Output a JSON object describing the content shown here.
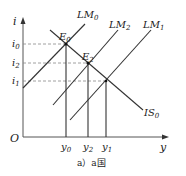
{
  "diagram": {
    "type": "IS-LM",
    "axes": {
      "y_label": "i",
      "x_label": "y",
      "origin": "O"
    },
    "curves": {
      "LM0": {
        "name": "LM",
        "sub": "0"
      },
      "LM2": {
        "name": "LM",
        "sub": "2"
      },
      "LM1": {
        "name": "LM",
        "sub": "1"
      },
      "IS0": {
        "name": "IS",
        "sub": "0"
      }
    },
    "points": {
      "E0": {
        "name": "E",
        "sub": "0"
      },
      "E2": {
        "name": "E",
        "sub": "2"
      }
    },
    "y_ticks": [
      {
        "name": "i",
        "sub": "0"
      },
      {
        "name": "i",
        "sub": "2"
      },
      {
        "name": "i",
        "sub": "1"
      }
    ],
    "x_ticks": [
      {
        "name": "y",
        "sub": "0"
      },
      {
        "name": "y",
        "sub": "2"
      },
      {
        "name": "y",
        "sub": "1"
      }
    ],
    "caption": "a）a国"
  }
}
